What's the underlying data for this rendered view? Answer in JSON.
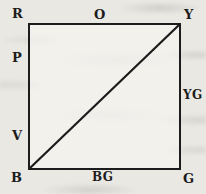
{
  "diagram": {
    "kind": "color-square-figure",
    "corners": {
      "top_left": "R",
      "top_right": "Y",
      "bottom_left": "B",
      "bottom_right": "G"
    },
    "edges": {
      "top": "O",
      "right": "YG",
      "bottom": "BG",
      "left_upper": "P",
      "left_lower": "V"
    },
    "diagonal": {
      "from": "B",
      "to": "Y"
    },
    "colors": {
      "ink": "#1c1c1c",
      "paper": "#eae8e3"
    }
  }
}
